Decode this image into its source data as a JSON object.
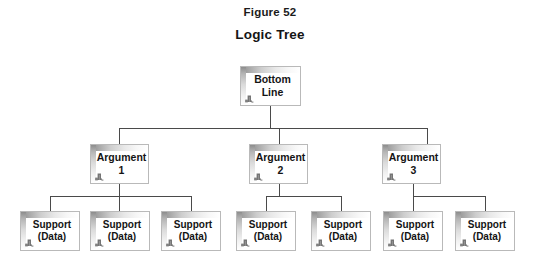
{
  "figure": {
    "label": "Figure 52",
    "title": "Logic Tree"
  },
  "diagram": {
    "type": "tree",
    "background_color": "#ffffff",
    "text_color": "#141414",
    "box_border_color": "#b9b9b9",
    "connector_color": "#4a4a4a",
    "node_icon_name": "box-corner-mark-icon",
    "root": {
      "id": "bottom-line",
      "label": "Bottom\nLine",
      "x": 240,
      "y": 66,
      "w": 61,
      "h": 40
    },
    "arguments": [
      {
        "id": "argument-1",
        "label": "Argument\n1",
        "x": 90,
        "y": 144,
        "w": 59,
        "h": 40
      },
      {
        "id": "argument-2",
        "label": "Argument\n2",
        "x": 249,
        "y": 144,
        "w": 59,
        "h": 40
      },
      {
        "id": "argument-3",
        "label": "Argument\n3",
        "x": 382,
        "y": 144,
        "w": 59,
        "h": 40
      }
    ],
    "supports": [
      {
        "id": "support-1",
        "parent": "argument-1",
        "label": "Support\n(Data)",
        "x": 20,
        "y": 211,
        "w": 60,
        "h": 40
      },
      {
        "id": "support-2",
        "parent": "argument-1",
        "label": "Support\n(Data)",
        "x": 90,
        "y": 211,
        "w": 60,
        "h": 40
      },
      {
        "id": "support-3",
        "parent": "argument-1",
        "label": "Support\n(Data)",
        "x": 161,
        "y": 211,
        "w": 60,
        "h": 40
      },
      {
        "id": "support-4",
        "parent": "argument-2",
        "label": "Support\n(Data)",
        "x": 236,
        "y": 211,
        "w": 60,
        "h": 40
      },
      {
        "id": "support-5",
        "parent": "argument-2",
        "label": "Support\n(Data)",
        "x": 311,
        "y": 211,
        "w": 60,
        "h": 40
      },
      {
        "id": "support-6",
        "parent": "argument-3",
        "label": "Support\n(Data)",
        "x": 383,
        "y": 211,
        "w": 60,
        "h": 40
      },
      {
        "id": "support-7",
        "parent": "argument-3",
        "label": "Support\n(Data)",
        "x": 455,
        "y": 211,
        "w": 60,
        "h": 40
      }
    ],
    "connectors": {
      "root_stem": {
        "x": 270,
        "y1": 106,
        "y2": 128
      },
      "level1_bus": {
        "x1": 119,
        "x2": 427,
        "y": 128
      },
      "level1_drops": [
        {
          "x": 119,
          "y1": 128,
          "y2": 144
        },
        {
          "x": 279,
          "y1": 128,
          "y2": 144
        },
        {
          "x": 427,
          "y1": 128,
          "y2": 144
        }
      ],
      "arg1_stem": {
        "x": 119,
        "y1": 184,
        "y2": 196
      },
      "arg1_bus": {
        "x1": 50,
        "x2": 191,
        "y": 196
      },
      "arg1_drops": [
        {
          "x": 50,
          "y1": 196,
          "y2": 211
        },
        {
          "x": 119,
          "y1": 196,
          "y2": 211
        },
        {
          "x": 191,
          "y1": 196,
          "y2": 211
        }
      ],
      "arg2_stem": {
        "x": 279,
        "y1": 184,
        "y2": 196
      },
      "arg2_bus": {
        "x1": 266,
        "x2": 341,
        "y": 196
      },
      "arg2_drops": [
        {
          "x": 266,
          "y1": 196,
          "y2": 211
        },
        {
          "x": 341,
          "y1": 196,
          "y2": 211
        }
      ],
      "arg3_stem": {
        "x": 413,
        "y1": 184,
        "y2": 196
      },
      "arg3_bus": {
        "x1": 413,
        "x2": 485,
        "y": 196
      },
      "arg3_drops": [
        {
          "x": 413,
          "y1": 196,
          "y2": 211
        },
        {
          "x": 485,
          "y1": 196,
          "y2": 211
        }
      ]
    }
  }
}
